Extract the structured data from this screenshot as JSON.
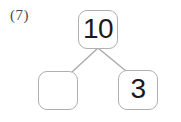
{
  "problem": {
    "label": "(7)"
  },
  "number_bond": {
    "total": {
      "value": "10",
      "empty": false
    },
    "parts": [
      {
        "value": "",
        "empty": true
      },
      {
        "value": "3",
        "empty": false
      }
    ]
  },
  "style": {
    "box_border_color": "#b0b0b0",
    "connector_color": "#a8a8a8",
    "numeral_color": "#1a1a1a",
    "label_color": "#4a4a4a",
    "background_color": "#ffffff"
  }
}
